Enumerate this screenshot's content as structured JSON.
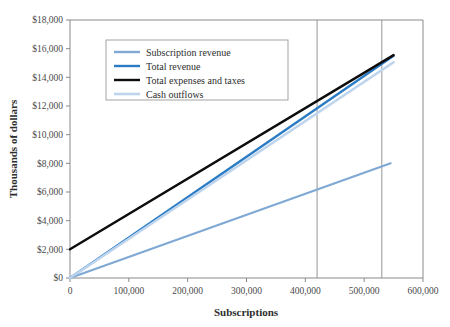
{
  "chart_data": {
    "type": "line",
    "title": "",
    "xlabel": "Subscriptions",
    "ylabel": "Thousands of dollars",
    "xlim": [
      0,
      600000
    ],
    "ylim": [
      0,
      18000
    ],
    "grid": false,
    "legend_position": "upper-left-inside",
    "x_ticks": [
      0,
      100000,
      200000,
      300000,
      400000,
      500000,
      600000
    ],
    "x_tick_labels": [
      "0",
      "100,000",
      "200,000",
      "300,000",
      "400,000",
      "500,000",
      "600,000"
    ],
    "y_ticks": [
      0,
      2000,
      4000,
      6000,
      8000,
      10000,
      12000,
      14000,
      16000,
      18000
    ],
    "y_tick_labels": [
      "$0",
      "$2,000",
      "$4,000",
      "$6,000",
      "$8,000",
      "$10,000",
      "$12,000",
      "$14,000",
      "$16,000",
      "$18,000"
    ],
    "series": [
      {
        "name": "Subscription revenue",
        "color": "#7FA9D4",
        "width": 2.2,
        "points": [
          [
            0,
            0
          ],
          [
            545000,
            8000
          ]
        ]
      },
      {
        "name": "Total revenue",
        "color": "#2B7CC4",
        "width": 2.4,
        "points": [
          [
            0,
            0
          ],
          [
            550000,
            15500
          ]
        ]
      },
      {
        "name": "Total expenses and taxes",
        "color": "#0D0D0D",
        "width": 2.4,
        "points": [
          [
            0,
            2000
          ],
          [
            550000,
            15550
          ]
        ]
      },
      {
        "name": "Cash outflows",
        "color": "#BDD4EC",
        "width": 2.6,
        "points": [
          [
            0,
            0
          ],
          [
            550000,
            15050
          ]
        ]
      }
    ],
    "reference_lines": [
      {
        "name": "break-even-marker-1",
        "x": 420000
      },
      {
        "name": "break-even-marker-2",
        "x": 530000
      }
    ]
  },
  "legend": {
    "entries": [
      {
        "label": "Subscription revenue"
      },
      {
        "label": "Total revenue"
      },
      {
        "label": "Total expenses and taxes"
      },
      {
        "label": "Cash outflows"
      }
    ]
  }
}
